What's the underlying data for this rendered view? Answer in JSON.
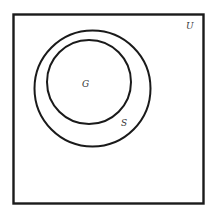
{
  "diagram": {
    "type": "venn",
    "universe": {
      "label": "U",
      "stroke": "#1a1a1a"
    },
    "sets": [
      {
        "id": "S",
        "label": "S",
        "contains": [
          "G"
        ],
        "stroke": "#1a1a1a"
      },
      {
        "id": "G",
        "label": "G",
        "contained_in": "S",
        "stroke": "#1a1a1a"
      }
    ],
    "background": "#ffffff"
  }
}
